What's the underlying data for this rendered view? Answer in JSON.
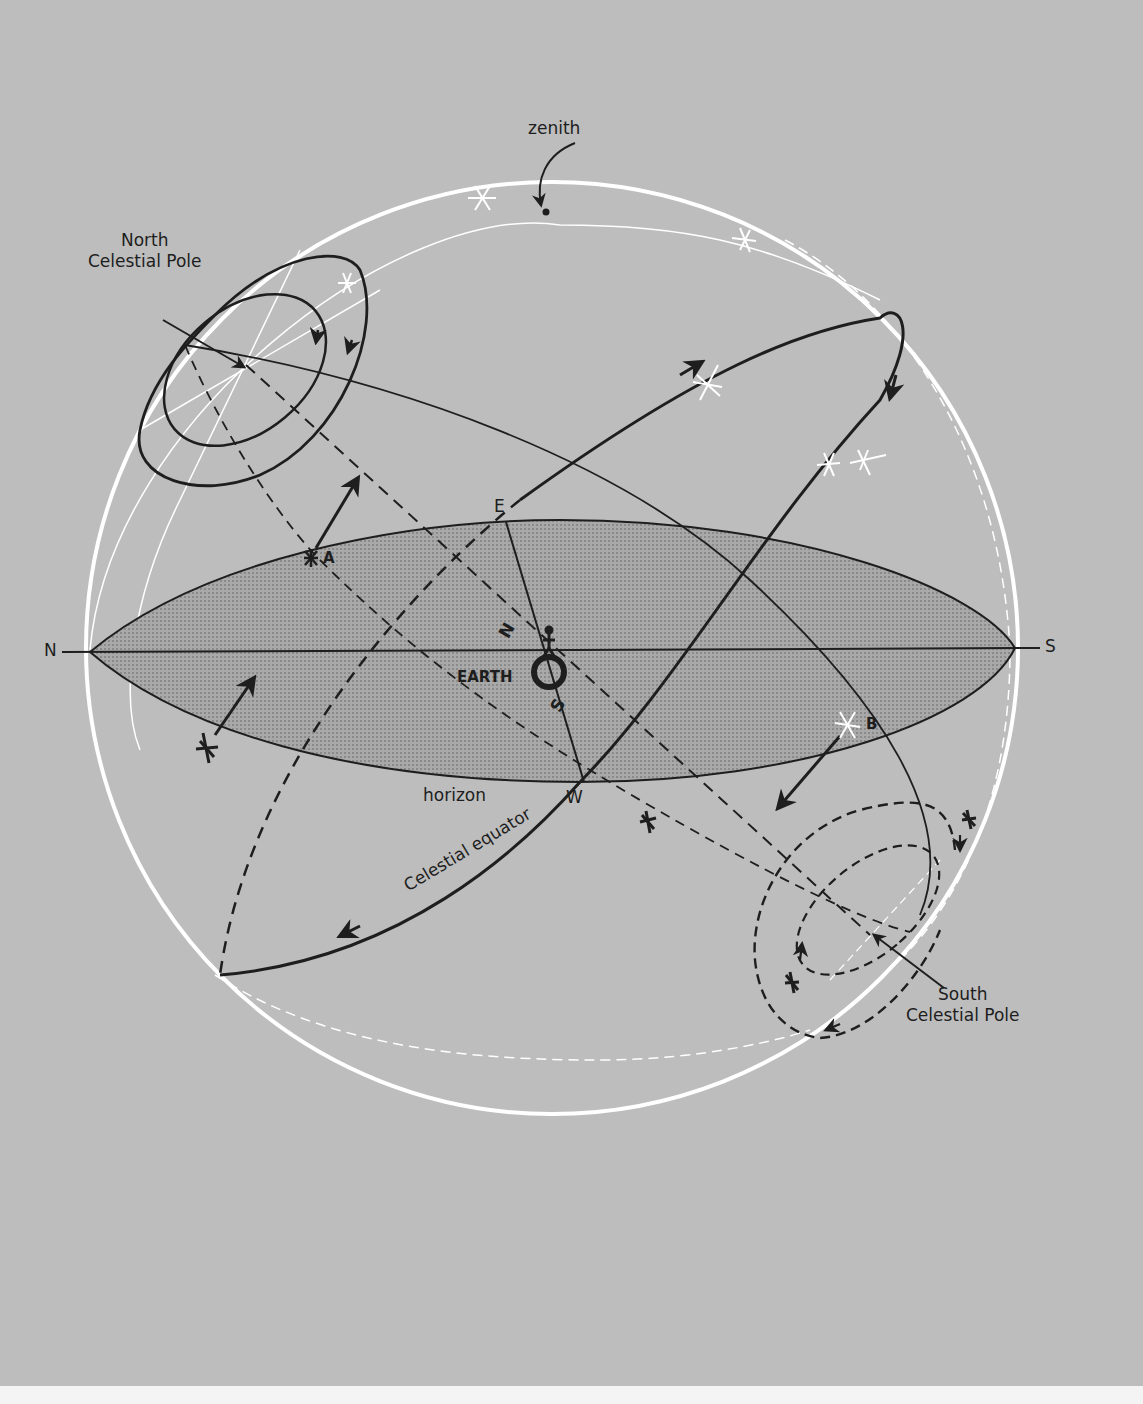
{
  "diagram": {
    "background_color": "#bdbdbd",
    "sphere_color": "#ffffff",
    "horizon_fill": "#a4a4a4",
    "line_color": "#1e1e1e",
    "labels": {
      "zenith": "zenith",
      "north_celestial_pole": "North\nCelestial Pole",
      "south_celestial_pole": "South\nCelestial Pole",
      "earth": "EARTH",
      "horizon": "horizon",
      "celestial_equator": "Celestial equator",
      "north": "N",
      "south": "S",
      "east": "E",
      "west": "W",
      "axis_north": "N",
      "axis_south": "S",
      "star_a": "A",
      "star_b": "B"
    },
    "icons": {
      "star": "asterisk-star",
      "observer": "person-figure",
      "earth": "ring"
    }
  }
}
